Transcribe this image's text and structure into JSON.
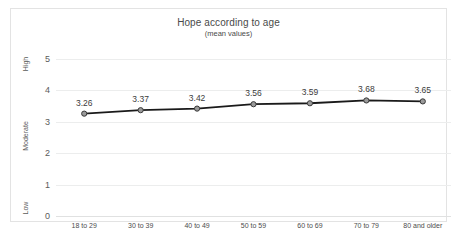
{
  "chart_data": {
    "type": "line",
    "title": "Hope according to age",
    "subtitle": "(mean values)",
    "xlabel": "",
    "ylabel": "",
    "categories": [
      "18 to 29",
      "30 to 39",
      "40 to 49",
      "50 to 59",
      "60 to 69",
      "70 to 79",
      "80 and older"
    ],
    "values": [
      3.26,
      3.37,
      3.42,
      3.56,
      3.59,
      3.68,
      3.65
    ],
    "data_labels": [
      "3.26",
      "3.37",
      "3.42",
      "3.56",
      "3.59",
      "3.68",
      "3.65"
    ],
    "series": [
      {
        "name": "Hope (mean)",
        "values": [
          3.26,
          3.37,
          3.42,
          3.56,
          3.59,
          3.68,
          3.65
        ]
      }
    ],
    "ylim": [
      0,
      5
    ],
    "yticks": [
      0,
      1,
      2,
      3,
      4,
      5
    ],
    "ytick_labels": [
      "0",
      "1",
      "2",
      "3",
      "4",
      "5"
    ],
    "y_band_labels": [
      {
        "label": "High",
        "at": 4.85
      },
      {
        "label": "Moderate",
        "at": 2.55
      },
      {
        "label": "Low",
        "at": 0.25
      }
    ],
    "grid": true,
    "legend": "none",
    "line_color": "#1a1a1a",
    "marker_fill": "#9a9a9a",
    "marker_edge": "#3a3a3a",
    "grid_color": "#eceded",
    "text_color": "#4a4a4a"
  }
}
